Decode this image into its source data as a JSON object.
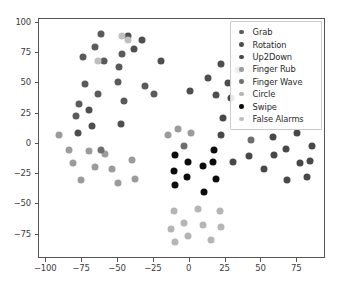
{
  "chart_data": {
    "type": "scatter",
    "title": "",
    "xlabel": "",
    "ylabel": "",
    "xlim": [
      -105,
      95
    ],
    "ylim": [
      -95,
      103
    ],
    "grid": false,
    "legend_position": "upper right",
    "xticks": [
      -100,
      -75,
      -50,
      -25,
      0,
      25,
      50,
      75
    ],
    "yticks": [
      -75,
      -50,
      -25,
      0,
      25,
      50,
      75,
      100
    ],
    "xtick_labels": [
      "-100",
      "-75",
      "-50",
      "-25",
      "0",
      "25",
      "50",
      "75"
    ],
    "ytick_labels": [
      "-75",
      "-50",
      "-25",
      "0",
      "25",
      "50",
      "75",
      "100"
    ],
    "marker_size": 7,
    "series": [
      {
        "name": "Grab",
        "color": "#5a5a5a",
        "points": [
          [
            -74,
            72
          ],
          [
            -66,
            80
          ],
          [
            -62,
            91
          ],
          [
            -60,
            68
          ],
          [
            -73,
            49
          ],
          [
            -64,
            41
          ],
          [
            -47,
            74
          ],
          [
            -49,
            63
          ],
          [
            -46,
            35
          ],
          [
            -50,
            51
          ],
          [
            -31,
            48
          ],
          [
            -25,
            41
          ],
          [
            -77,
            33
          ],
          [
            -79,
            23
          ]
        ]
      },
      {
        "name": "Rotation",
        "color": "#4e4e4e",
        "points": [
          [
            -78,
            9
          ],
          [
            -68,
            15
          ],
          [
            -70,
            28
          ],
          [
            -48,
            16
          ],
          [
            -33,
            86
          ],
          [
            -39,
            78
          ],
          [
            -43,
            89
          ],
          [
            -20,
            68
          ],
          [
            0,
            44
          ],
          [
            13,
            54
          ],
          [
            22,
            66
          ],
          [
            18,
            40
          ],
          [
            27,
            50
          ]
        ]
      },
      {
        "name": "Up2Down",
        "color": "#484848",
        "points": [
          [
            29,
            38
          ],
          [
            23,
            21
          ],
          [
            22,
            7
          ],
          [
            30,
            -15
          ],
          [
            41,
            -10
          ],
          [
            52,
            -21
          ],
          [
            58,
            6
          ],
          [
            59,
            -9
          ],
          [
            67,
            -4
          ],
          [
            68,
            -30
          ],
          [
            75,
            9
          ],
          [
            77,
            -16
          ],
          [
            85,
            -2
          ],
          [
            84,
            -14
          ],
          [
            82,
            -27
          ]
        ]
      },
      {
        "name": "Finger Rub",
        "color": "#9b9b9b",
        "points": [
          [
            -91,
            7
          ],
          [
            -84,
            -5
          ],
          [
            -81,
            -16
          ],
          [
            -76,
            -30
          ],
          [
            -70,
            -6
          ],
          [
            -66,
            -19
          ],
          [
            -59,
            -8
          ],
          [
            -54,
            -21
          ],
          [
            -50,
            -32
          ],
          [
            -40,
            -13
          ],
          [
            -38,
            -29
          ],
          [
            -15,
            7
          ],
          [
            -8,
            12
          ],
          [
            1,
            9
          ]
        ]
      },
      {
        "name": "Finger Wave",
        "color": "#6e6e6e",
        "points": [
          [
            -62,
            -5
          ],
          [
            -4,
            -2
          ],
          [
            34,
            61
          ],
          [
            43,
            3
          ]
        ]
      },
      {
        "name": "Circle",
        "color": "#b5b5b5",
        "points": [
          [
            -11,
            -55
          ],
          [
            -13,
            -70
          ],
          [
            -10,
            -81
          ],
          [
            -4,
            -65
          ],
          [
            -1,
            -76
          ],
          [
            6,
            -54
          ],
          [
            9,
            -67
          ],
          [
            15,
            -79
          ],
          [
            21,
            -55
          ],
          [
            22,
            -69
          ]
        ]
      },
      {
        "name": "Swipe",
        "color": "#0c0c0c",
        "points": [
          [
            -10,
            -9
          ],
          [
            -11,
            -22
          ],
          [
            -10,
            -34
          ],
          [
            -1,
            -15
          ],
          [
            -2,
            -27
          ],
          [
            9,
            -18
          ],
          [
            10,
            -40
          ],
          [
            17,
            -5
          ],
          [
            16,
            -15
          ],
          [
            18,
            -29
          ]
        ]
      },
      {
        "name": "False Alarms",
        "color": "#bfbfbf",
        "points": [
          [
            -64,
            68
          ],
          [
            -47,
            89
          ],
          [
            -43,
            86
          ]
        ]
      }
    ]
  },
  "legend": {
    "entries": [
      {
        "label": "Grab",
        "color": "#5a5a5a"
      },
      {
        "label": "Rotation",
        "color": "#4e4e4e"
      },
      {
        "label": "Up2Down",
        "color": "#484848"
      },
      {
        "label": "Finger Rub",
        "color": "#9b9b9b"
      },
      {
        "label": "Finger Wave",
        "color": "#6e6e6e"
      },
      {
        "label": "Circle",
        "color": "#b5b5b5"
      },
      {
        "label": "Swipe",
        "color": "#0c0c0c"
      },
      {
        "label": "False Alarms",
        "color": "#bfbfbf"
      }
    ]
  }
}
